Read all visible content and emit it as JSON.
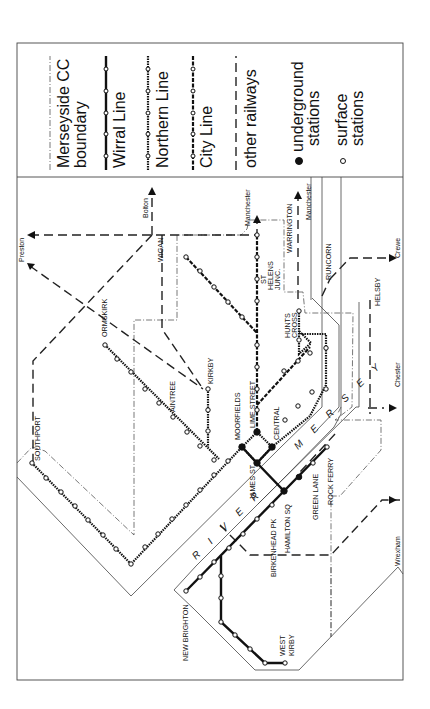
{
  "legend": {
    "items": [
      {
        "key": "boundary",
        "label_lines": [
          "Merseyside CC",
          "boundary"
        ]
      },
      {
        "key": "wirral",
        "label_lines": [
          "Wirral Line"
        ]
      },
      {
        "key": "northern",
        "label_lines": [
          "Northern Line"
        ]
      },
      {
        "key": "city",
        "label_lines": [
          "City Line"
        ]
      },
      {
        "key": "other",
        "label_lines": [
          "other railways"
        ]
      },
      {
        "key": "underground",
        "label_lines": [
          "underground",
          "stations"
        ]
      },
      {
        "key": "surface",
        "label_lines": [
          "surface",
          "stations"
        ]
      }
    ]
  },
  "river": {
    "label_1": "R I V E R",
    "label_2": "M E R S E Y"
  },
  "stations": [
    {
      "name": "SOUTHPORT",
      "x": 32,
      "y": 463,
      "type": "surface",
      "lx": 40,
      "ly": 461
    },
    {
      "name": "ORMSKIRK",
      "x": 105,
      "y": 345,
      "type": "surface",
      "lx": 107,
      "ly": 337
    },
    {
      "name": "AINTREE",
      "x": 173,
      "y": 417,
      "type": "surface",
      "lx": 175,
      "ly": 412
    },
    {
      "name": "KIRKBY",
      "x": 208,
      "y": 389,
      "type": "surface",
      "lx": 213,
      "ly": 384
    },
    {
      "name": "WIGAN",
      "x": 0,
      "y": 0,
      "type": "label",
      "lx": 163,
      "ly": 262
    },
    {
      "name": "MOORFIELDS",
      "x": 242,
      "y": 447,
      "type": "underground",
      "lx": 240,
      "ly": 440
    },
    {
      "name": "LIME STREET",
      "x": 257,
      "y": 432,
      "type": "underground",
      "lx": 255,
      "ly": 428
    },
    {
      "name": "CENTRAL",
      "x": 272,
      "y": 447,
      "type": "underground",
      "lx": 279,
      "ly": 440
    },
    {
      "name": "JAMES ST",
      "x": 257,
      "y": 463,
      "type": "underground",
      "lx": 255,
      "ly": 500
    },
    {
      "name": "HAMILTON SQ",
      "x": 284,
      "y": 491,
      "type": "underground",
      "lx": 290,
      "ly": 553
    },
    {
      "name": "BIRKENHEAD PK",
      "x": 272,
      "y": 505,
      "type": "surface",
      "lx": 276,
      "ly": 577
    },
    {
      "name": "GREEN LANE",
      "x": 313,
      "y": 463,
      "type": "surface",
      "lx": 318,
      "ly": 520
    },
    {
      "name": "ROCK FERRY",
      "x": 327,
      "y": 447,
      "type": "surface",
      "lx": 333,
      "ly": 505
    },
    {
      "name": "NEW BRIGHTON",
      "x": 186,
      "y": 591,
      "type": "surface",
      "lx": 188,
      "ly": 661
    },
    {
      "name": "WEST",
      "x": 285,
      "y": 663,
      "type": "surface",
      "lx": 285,
      "ly": 656
    },
    {
      "name": "KIRBY",
      "x": 0,
      "y": 0,
      "type": "label",
      "lx": 294,
      "ly": 656
    },
    {
      "name": "ST",
      "x": 0,
      "y": 0,
      "type": "label",
      "lx": 266,
      "ly": 284
    },
    {
      "name": "HELENS",
      "x": 0,
      "y": 0,
      "type": "label",
      "lx": 273,
      "ly": 290
    },
    {
      "name": "JUNC.",
      "x": 0,
      "y": 0,
      "type": "label",
      "lx": 280,
      "ly": 290
    },
    {
      "name": "HUNTS",
      "x": 0,
      "y": 0,
      "type": "label",
      "lx": 290,
      "ly": 338
    },
    {
      "name": "CROSS",
      "x": 0,
      "y": 0,
      "type": "label",
      "lx": 297,
      "ly": 338
    },
    {
      "name": "WARRINGTON",
      "x": 0,
      "y": 0,
      "type": "label",
      "lx": 292,
      "ly": 253
    },
    {
      "name": "RUNCORN",
      "x": 0,
      "y": 0,
      "type": "label",
      "lx": 331,
      "ly": 280
    },
    {
      "name": "HELSBY",
      "x": 0,
      "y": 0,
      "type": "label",
      "lx": 380,
      "ly": 306
    }
  ],
  "destinations": [
    {
      "name": "Preston",
      "lx": 24,
      "ly": 262
    },
    {
      "name": "Bolton",
      "lx": 148,
      "ly": 218
    },
    {
      "name": "Manchester",
      "lx": 250,
      "ly": 226
    },
    {
      "name": "Manchester",
      "lx": 311,
      "ly": 220
    },
    {
      "name": "Crewe",
      "lx": 400,
      "ly": 258
    },
    {
      "name": "Chester",
      "lx": 400,
      "ly": 387
    },
    {
      "name": "Wrexham",
      "lx": 400,
      "ly": 566
    }
  ],
  "colors": {
    "ink": "#111111",
    "frame": "#444444",
    "paper": "#ffffff"
  }
}
